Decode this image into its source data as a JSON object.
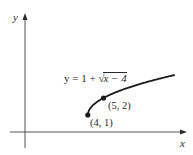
{
  "chart_data": {
    "type": "line",
    "title": "",
    "function": "y = 1 + sqrt(x - 4)",
    "equation_label": {
      "prefix": "y = 1 + ",
      "radical_symbol": "√",
      "radicand": "x − 4"
    },
    "xlabel": "x",
    "ylabel": "y",
    "grid": false,
    "legend": null,
    "x_domain_drawn": [
      4,
      9.5
    ],
    "series": [
      {
        "name": "y = 1 + √(x − 4)",
        "color": "#1a1a1a",
        "x": [
          4,
          4.1,
          4.25,
          4.5,
          5,
          5.5,
          6,
          6.5,
          7,
          7.5,
          8,
          8.5,
          9,
          9.5
        ],
        "y": [
          1,
          1.316,
          1.5,
          1.707,
          2,
          2.225,
          2.414,
          2.581,
          2.732,
          2.871,
          3,
          3.121,
          3.236,
          3.345
        ]
      }
    ],
    "points": [
      {
        "x": 4,
        "y": 1,
        "label": "(4, 1)"
      },
      {
        "x": 5,
        "y": 2,
        "label": "(5, 2)"
      }
    ],
    "axes": {
      "x_arrow": true,
      "y_arrow": true,
      "tick_labels": false
    }
  },
  "labels": {
    "x_axis": "x",
    "y_axis": "y",
    "eq_prefix": "y = 1 + ",
    "eq_radical": "√",
    "eq_radicand": "x − 4",
    "point_a": "(4, 1)",
    "point_b": "(5, 2)"
  },
  "colors": {
    "axis": "#2a2a2a",
    "curve": "#1a1a1a",
    "background": "#ffffff"
  }
}
